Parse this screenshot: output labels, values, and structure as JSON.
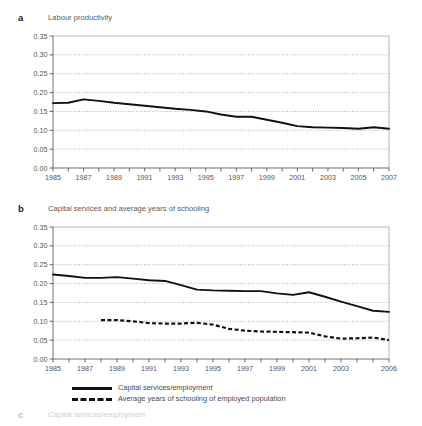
{
  "figure": {
    "background": "#ffffff",
    "line_color": "#111111",
    "grid_color": "#7d7d7d",
    "frame_color": "#9a9a9a"
  },
  "panels": [
    {
      "letter": "a",
      "title": "Labour productivity"
    },
    {
      "letter": "b",
      "title": "Capital services and average years of schooling"
    },
    {
      "letter": "c",
      "title": "Capital services/employment"
    }
  ],
  "legend": {
    "items": [
      {
        "label": "Capital services/employment",
        "style": "solid"
      },
      {
        "label": "Average years of schooling of employed population",
        "style": "dashed"
      }
    ]
  },
  "chart_data": [
    {
      "type": "line",
      "title": "Labour productivity",
      "panel": "a",
      "xlabel": "",
      "ylabel": "",
      "xlim": [
        1985,
        2007
      ],
      "ylim": [
        0.0,
        0.35
      ],
      "yticks": [
        "0.00",
        "0.05",
        "0.10",
        "0.15",
        "0.20",
        "0.25",
        "0.30",
        "0.35"
      ],
      "ytick_values": [
        0.0,
        0.05,
        0.1,
        0.15,
        0.2,
        0.25,
        0.3,
        0.35
      ],
      "xticks": [
        1985,
        1986,
        1987,
        1988,
        1989,
        1990,
        1991,
        1992,
        1993,
        1994,
        1995,
        1996,
        1997,
        1998,
        1999,
        2000,
        2001,
        2002,
        2003,
        2004,
        2005,
        2006,
        2007
      ],
      "xtick_labels": [
        "1985",
        "",
        "1987",
        "",
        "1989",
        "",
        "1991",
        "",
        "1993",
        "",
        "1995",
        "",
        "1997",
        "",
        "1999",
        "",
        "2001",
        "",
        "2003",
        "",
        "2005",
        "",
        "2007"
      ],
      "grid": true,
      "legend_position": "none",
      "series": [
        {
          "name": "Labour productivity",
          "style": "solid",
          "x": [
            1985,
            1986,
            1987,
            1988,
            1989,
            1990,
            1991,
            1992,
            1993,
            1994,
            1995,
            1996,
            1997,
            1998,
            1999,
            2000,
            2001,
            2002,
            2003,
            2004,
            2005,
            2006,
            2007
          ],
          "values": [
            0.172,
            0.173,
            0.182,
            0.178,
            0.173,
            0.169,
            0.165,
            0.161,
            0.157,
            0.154,
            0.15,
            0.142,
            0.136,
            0.136,
            0.128,
            0.12,
            0.111,
            0.108,
            0.107,
            0.106,
            0.104,
            0.108,
            0.104
          ]
        }
      ]
    },
    {
      "type": "line",
      "title": "Capital services and average years of schooling",
      "panel": "b",
      "xlabel": "",
      "ylabel": "",
      "xlim": [
        1985,
        2006
      ],
      "ylim": [
        0.0,
        0.35
      ],
      "yticks": [
        "0.00",
        "0.05",
        "0.10",
        "0.15",
        "0.20",
        "0.25",
        "0.30",
        "0.35"
      ],
      "ytick_values": [
        0.0,
        0.05,
        0.1,
        0.15,
        0.2,
        0.25,
        0.3,
        0.35
      ],
      "xticks": [
        1985,
        1986,
        1987,
        1988,
        1989,
        1990,
        1991,
        1992,
        1993,
        1994,
        1995,
        1996,
        1997,
        1998,
        1999,
        2000,
        2001,
        2002,
        2003,
        2004,
        2005,
        2006
      ],
      "xtick_labels": [
        "1985",
        "",
        "1987",
        "",
        "1989",
        "",
        "1991",
        "",
        "1993",
        "",
        "1995",
        "",
        "1997",
        "",
        "1999",
        "",
        "2001",
        "",
        "2003",
        "",
        "",
        "2006"
      ],
      "grid": true,
      "legend_position": "bottom",
      "series": [
        {
          "name": "Capital services/employment",
          "style": "solid",
          "x": [
            1985,
            1986,
            1987,
            1988,
            1989,
            1990,
            1991,
            1992,
            1993,
            1994,
            1995,
            1996,
            1997,
            1998,
            1999,
            2000,
            2001,
            2002,
            2003,
            2004,
            2005,
            2006
          ],
          "values": [
            0.224,
            0.22,
            0.215,
            0.215,
            0.217,
            0.213,
            0.209,
            0.207,
            0.196,
            0.184,
            0.182,
            0.181,
            0.18,
            0.18,
            0.174,
            0.17,
            0.177,
            0.165,
            0.152,
            0.14,
            0.128,
            0.125
          ]
        },
        {
          "name": "Average years of schooling of employed population",
          "style": "dashed",
          "x": [
            1988,
            1989,
            1990,
            1991,
            1992,
            1993,
            1994,
            1995,
            1996,
            1997,
            1998,
            1999,
            2000,
            2001,
            2002,
            2003,
            2004,
            2005,
            2006
          ],
          "values": [
            0.103,
            0.103,
            0.1,
            0.095,
            0.094,
            0.094,
            0.096,
            0.091,
            0.08,
            0.075,
            0.073,
            0.072,
            0.071,
            0.07,
            0.06,
            0.054,
            0.055,
            0.057,
            0.05
          ]
        }
      ]
    }
  ]
}
